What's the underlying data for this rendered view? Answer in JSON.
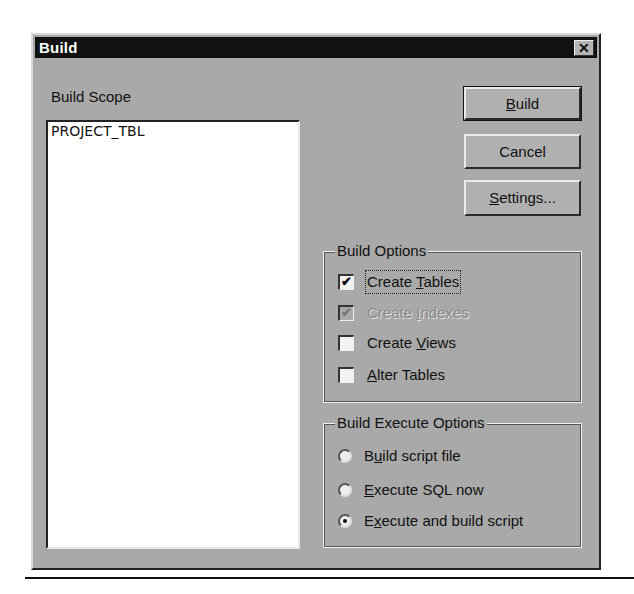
{
  "dialog": {
    "title": "Build",
    "close_icon": "close-icon"
  },
  "scope": {
    "label": "Build Scope",
    "items": [
      "PROJECT_TBL"
    ]
  },
  "buttons": {
    "build": {
      "pre": "",
      "accel": "B",
      "post": "uild"
    },
    "cancel": {
      "label": "Cancel"
    },
    "settings": {
      "pre": "",
      "accel": "S",
      "post": "ettings..."
    }
  },
  "build_options": {
    "legend": "Build Options",
    "items": [
      {
        "pre": "Create ",
        "accel": "T",
        "post": "ables",
        "checked": true,
        "enabled": true,
        "focused": true
      },
      {
        "pre": "Create ",
        "accel": "I",
        "post": "ndexes",
        "checked": true,
        "enabled": false
      },
      {
        "pre": "Create ",
        "accel": "V",
        "post": "iews",
        "checked": false,
        "enabled": true
      },
      {
        "pre": "",
        "accel": "A",
        "post": "lter Tables",
        "checked": false,
        "enabled": true
      }
    ]
  },
  "execute_options": {
    "legend": "Build Execute Options",
    "items": [
      {
        "pre": "B",
        "accel": "u",
        "post": "ild script file",
        "selected": false
      },
      {
        "pre": "",
        "accel": "E",
        "post": "xecute SQL now",
        "selected": false
      },
      {
        "pre": "E",
        "accel": "x",
        "post": "ecute and build script",
        "selected": true
      }
    ]
  },
  "colors": {
    "titlebar": "#111111",
    "dialog_bg": "#a9a9a9",
    "list_bg": "#ffffff"
  }
}
